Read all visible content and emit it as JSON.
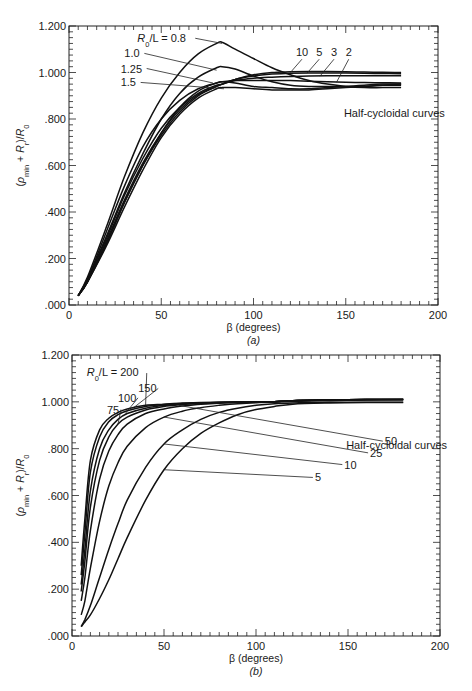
{
  "chart_data": [
    {
      "id": "a",
      "type": "line",
      "title": "",
      "subtitle": "Half-cycloidal curves",
      "caption": "(a)",
      "xlabel": "β (degrees)",
      "ylabel": "(ρmin + Rr)/R0",
      "xlim": [
        0,
        200
      ],
      "ylim": [
        0,
        1.2
      ],
      "xticks": [
        0,
        50,
        100,
        150,
        200
      ],
      "xtick_labels": [
        "0",
        "50",
        "100",
        "150",
        "200"
      ],
      "yticks": [
        0,
        0.2,
        0.4,
        0.6,
        0.8,
        1.0,
        1.2
      ],
      "ytick_labels": [
        ".000",
        ".200",
        ".400",
        ".600",
        ".800",
        "1.000",
        "1.200"
      ],
      "grid": false,
      "legend_title": "R0/L = ",
      "x": [
        5,
        10,
        20,
        30,
        40,
        50,
        60,
        70,
        80,
        83,
        90,
        100,
        110,
        120,
        130,
        140,
        150,
        160,
        170,
        180
      ],
      "series": [
        {
          "name": "0.8",
          "values": [
            0.04,
            0.12,
            0.33,
            0.55,
            0.74,
            0.89,
            1.0,
            1.08,
            1.125,
            1.13,
            1.1,
            1.06,
            1.02,
            0.99,
            0.965,
            0.95,
            0.94,
            0.935,
            0.935,
            0.935
          ]
        },
        {
          "name": "1.0",
          "values": [
            0.04,
            0.11,
            0.29,
            0.48,
            0.65,
            0.8,
            0.91,
            0.98,
            1.02,
            1.025,
            1.015,
            0.985,
            0.96,
            0.945,
            0.94,
            0.94,
            0.94,
            0.94,
            0.945,
            0.945
          ]
        },
        {
          "name": "1.25",
          "values": [
            0.04,
            0.1,
            0.26,
            0.44,
            0.6,
            0.74,
            0.85,
            0.92,
            0.955,
            0.96,
            0.955,
            0.94,
            0.935,
            0.93,
            0.93,
            0.935,
            0.94,
            0.945,
            0.95,
            0.95
          ]
        },
        {
          "name": "1.5",
          "values": [
            0.04,
            0.1,
            0.25,
            0.42,
            0.58,
            0.72,
            0.82,
            0.89,
            0.93,
            0.935,
            0.935,
            0.93,
            0.925,
            0.925,
            0.925,
            0.93,
            0.935,
            0.94,
            0.945,
            0.95
          ]
        },
        {
          "name": "2",
          "values": [
            0.04,
            0.11,
            0.31,
            0.51,
            0.68,
            0.8,
            0.88,
            0.93,
            0.955,
            0.96,
            0.965,
            0.965,
            0.965,
            0.965,
            0.962,
            0.96,
            0.958,
            0.957,
            0.956,
            0.955
          ]
        },
        {
          "name": "3",
          "values": [
            0.04,
            0.11,
            0.28,
            0.47,
            0.63,
            0.76,
            0.85,
            0.91,
            0.945,
            0.95,
            0.965,
            0.975,
            0.98,
            0.983,
            0.985,
            0.986,
            0.986,
            0.986,
            0.986,
            0.986
          ]
        },
        {
          "name": "5",
          "values": [
            0.04,
            0.1,
            0.27,
            0.45,
            0.61,
            0.74,
            0.84,
            0.905,
            0.94,
            0.95,
            0.97,
            0.985,
            0.993,
            0.997,
            0.998,
            0.998,
            0.998,
            0.997,
            0.996,
            0.995
          ]
        },
        {
          "name": "10",
          "values": [
            0.04,
            0.1,
            0.26,
            0.44,
            0.6,
            0.73,
            0.83,
            0.9,
            0.94,
            0.95,
            0.97,
            0.99,
            1.0,
            1.003,
            1.004,
            1.004,
            1.003,
            1.002,
            1.001,
            1.0
          ]
        }
      ],
      "annotations": [
        {
          "text": "R0/L = 0.8",
          "x": 37,
          "y": 1.13
        },
        {
          "text": "1.0",
          "x": 30,
          "y": 1.065
        },
        {
          "text": "1.25",
          "x": 28,
          "y": 1.0
        },
        {
          "text": "1.5",
          "x": 28,
          "y": 0.94
        },
        {
          "text": "10",
          "x": 123,
          "y": 1.07
        },
        {
          "text": "5",
          "x": 134,
          "y": 1.07
        },
        {
          "text": "3",
          "x": 142,
          "y": 1.07
        },
        {
          "text": "2",
          "x": 150,
          "y": 1.07
        },
        {
          "text": "Half-cycloidal curves",
          "x": 149,
          "y": 0.81
        }
      ]
    },
    {
      "id": "b",
      "type": "line",
      "title": "",
      "subtitle": "Half-cycloidal curves",
      "caption": "(b)",
      "xlabel": "β (degrees)",
      "ylabel": "(ρmin + Rr)/R0",
      "xlim": [
        0,
        200
      ],
      "ylim": [
        0,
        1.2
      ],
      "xticks": [
        0,
        50,
        100,
        150,
        200
      ],
      "xtick_labels": [
        "0",
        "50",
        "100",
        "150",
        "200"
      ],
      "yticks": [
        0,
        0.2,
        0.4,
        0.6,
        0.8,
        1.0,
        1.2
      ],
      "ytick_labels": [
        ".000",
        ".200",
        ".400",
        ".600",
        ".800",
        "1.000",
        "1.200"
      ],
      "grid": false,
      "legend_title": "R0/L = ",
      "x": [
        5,
        7,
        10,
        15,
        20,
        25,
        30,
        40,
        50,
        60,
        70,
        80,
        90,
        100,
        110,
        120,
        140,
        160,
        180
      ],
      "series": [
        {
          "name": "200",
          "values": [
            0.3,
            0.5,
            0.75,
            0.88,
            0.93,
            0.955,
            0.97,
            0.985,
            0.99,
            0.995,
            0.997,
            0.998,
            0.999,
            1.0,
            1.0,
            1.005,
            1.008,
            1.01,
            1.01
          ]
        },
        {
          "name": "150",
          "values": [
            0.26,
            0.44,
            0.7,
            0.85,
            0.915,
            0.945,
            0.962,
            0.98,
            0.988,
            0.993,
            0.996,
            0.998,
            0.999,
            1.0,
            1.0,
            1.005,
            1.008,
            1.01,
            1.01
          ]
        },
        {
          "name": "100",
          "values": [
            0.22,
            0.37,
            0.62,
            0.8,
            0.88,
            0.925,
            0.95,
            0.973,
            0.985,
            0.991,
            0.995,
            0.997,
            0.999,
            1.0,
            1.0,
            1.005,
            1.008,
            1.01,
            1.01
          ]
        },
        {
          "name": "75",
          "values": [
            0.19,
            0.32,
            0.55,
            0.75,
            0.85,
            0.905,
            0.935,
            0.965,
            0.98,
            0.988,
            0.993,
            0.996,
            0.998,
            1.0,
            1.0,
            1.005,
            1.008,
            1.01,
            1.01
          ]
        },
        {
          "name": "50",
          "values": [
            0.15,
            0.25,
            0.45,
            0.67,
            0.79,
            0.86,
            0.905,
            0.95,
            0.97,
            0.982,
            0.99,
            0.994,
            0.997,
            0.999,
            1.0,
            1.005,
            1.008,
            1.01,
            1.01
          ]
        },
        {
          "name": "25",
          "values": [
            0.09,
            0.15,
            0.29,
            0.49,
            0.64,
            0.74,
            0.81,
            0.89,
            0.935,
            0.96,
            0.975,
            0.985,
            0.992,
            0.996,
            0.999,
            1.002,
            1.005,
            1.008,
            1.01
          ]
        },
        {
          "name": "10",
          "values": [
            0.04,
            0.07,
            0.13,
            0.25,
            0.37,
            0.48,
            0.58,
            0.72,
            0.82,
            0.88,
            0.925,
            0.955,
            0.973,
            0.985,
            0.992,
            0.995,
            0.998,
            0.998,
            0.998
          ]
        },
        {
          "name": "5",
          "values": [
            0.04,
            0.06,
            0.09,
            0.16,
            0.24,
            0.33,
            0.42,
            0.58,
            0.71,
            0.8,
            0.865,
            0.91,
            0.945,
            0.967,
            0.98,
            0.99,
            0.995,
            0.997,
            0.997
          ]
        }
      ],
      "annotations": [
        {
          "text": "R0/L = 200",
          "x": 8,
          "y": 1.11
        },
        {
          "text": "150",
          "x": 36,
          "y": 1.04
        },
        {
          "text": "100",
          "x": 25,
          "y": 1.0
        },
        {
          "text": "75",
          "x": 19,
          "y": 0.95
        },
        {
          "text": "50",
          "x": 170,
          "y": 0.815
        },
        {
          "text": "25",
          "x": 162,
          "y": 0.765
        },
        {
          "text": "10",
          "x": 148,
          "y": 0.715
        },
        {
          "text": "5",
          "x": 132,
          "y": 0.66
        },
        {
          "text": "Half-cycloidal curves",
          "x": 149,
          "y": 0.8
        }
      ]
    }
  ],
  "panels": {
    "a": {
      "caption": "(a)",
      "xlabel": "β (degrees)",
      "note": "Half-cycloidal curves"
    },
    "b": {
      "caption": "(b)",
      "xlabel": "β (degrees)",
      "note": "Half-cycloidal curves"
    }
  }
}
